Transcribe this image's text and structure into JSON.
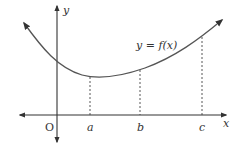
{
  "diagram": {
    "curve_label": "y = f(x)",
    "axes": {
      "x_label": "x",
      "y_label": "y",
      "origin_label": "O"
    },
    "x_markers": [
      {
        "label": "a",
        "x": 90,
        "y_top": 77
      },
      {
        "label": "b",
        "x": 140,
        "y_top": 72
      },
      {
        "label": "c",
        "x": 202,
        "y_top": 36
      }
    ],
    "colors": {
      "axis": "#333333",
      "curve": "#555555",
      "dashed": "#444444",
      "text": "#333333"
    }
  }
}
